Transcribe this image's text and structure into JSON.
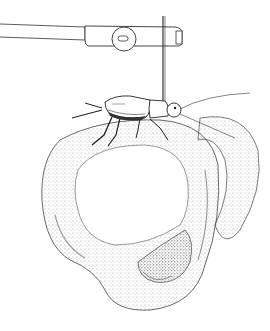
{
  "image": {
    "type": "scientific pen-and-ink illustration",
    "width": 270,
    "height": 331,
    "background": "#ffffff",
    "ink_color": "#2a2a2a",
    "subjects": [
      {
        "name": "tether-arm",
        "description": "horizontal rod with clamp block and round screw knob"
      },
      {
        "name": "vertical-pin",
        "description": "thin vertical wire glued to insect thorax"
      },
      {
        "name": "cricket",
        "description": "tethered cricket with long antennae and legs gripping the ball"
      },
      {
        "name": "foam-trefoil",
        "description": "stippled knotted foam ring (trefoil-like loop) held by the cricket"
      }
    ]
  }
}
